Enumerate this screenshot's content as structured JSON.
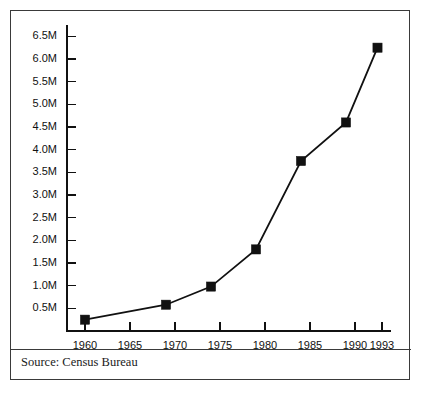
{
  "figure": {
    "source_note": "Source: Census Bureau",
    "background_color": "#ffffff",
    "frame_color": "#3a3a3a",
    "ink_color": "#111111"
  },
  "chart_data": {
    "type": "line",
    "title": "",
    "subtitle": "",
    "xlabel": "",
    "ylabel": "",
    "grid": false,
    "legend": "none",
    "marker": "square",
    "line_color": "#111111",
    "marker_color": "#111111",
    "xlim": [
      1958.0,
      1994.0
    ],
    "ylim": [
      0.0,
      6.75
    ],
    "y_unit": "M",
    "y_tick_values": [
      0.5,
      1.0,
      1.5,
      2.0,
      2.5,
      3.0,
      3.5,
      4.0,
      4.5,
      5.0,
      5.5,
      6.0,
      6.5
    ],
    "y_tick_labels": [
      "0.5M",
      "1.0M",
      "1.5M",
      "2.0M",
      "2.5M",
      "3.0M",
      "3.5M",
      "4.0M",
      "4.5M",
      "5.0M",
      "5.5M",
      "6.0M",
      "6.5M"
    ],
    "x_tick_values": [
      1960,
      1965,
      1970,
      1975,
      1980,
      1985,
      1990,
      1993
    ],
    "x_tick_labels": [
      "1960",
      "1965",
      "1970",
      "1975",
      "1980",
      "1985",
      "1990",
      "1993"
    ],
    "x": [
      1960,
      1969,
      1974,
      1979,
      1984,
      1989,
      1992.5
    ],
    "values": [
      0.25,
      0.58,
      0.98,
      1.8,
      3.75,
      4.6,
      6.25
    ],
    "points": [
      {
        "x": 1960,
        "y": 0.25,
        "label": "0.25M"
      },
      {
        "x": 1969,
        "y": 0.58,
        "label": "0.58M"
      },
      {
        "x": 1974,
        "y": 0.98,
        "label": "0.98M"
      },
      {
        "x": 1979,
        "y": 1.8,
        "label": "1.8M"
      },
      {
        "x": 1984,
        "y": 3.75,
        "label": "3.75M"
      },
      {
        "x": 1989,
        "y": 4.6,
        "label": "4.6M"
      },
      {
        "x": 1992.5,
        "y": 6.25,
        "label": "6.25M"
      }
    ]
  }
}
